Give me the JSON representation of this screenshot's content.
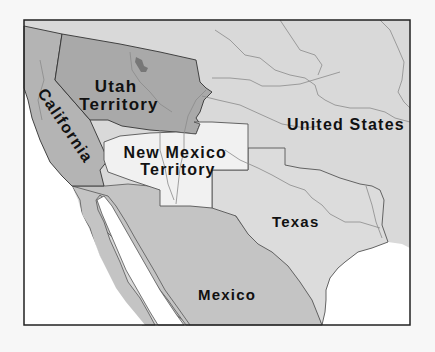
{
  "map": {
    "regions": [
      {
        "id": "utah-territory",
        "label_lines": [
          "Utah",
          "Territory"
        ],
        "fill": "#a9a9a9"
      },
      {
        "id": "california",
        "label": "California",
        "fill": "#b4b4b4"
      },
      {
        "id": "new-mexico-territory",
        "label_lines": [
          "New Mexico",
          "Territory"
        ],
        "fill": "#f1f1f1"
      },
      {
        "id": "united-states",
        "label": "United States",
        "fill": "#d9d9d9"
      },
      {
        "id": "texas",
        "label": "Texas",
        "fill": "#dcdcdc"
      },
      {
        "id": "mexico",
        "label": "Mexico",
        "fill": "#c4c4c4"
      }
    ],
    "colors": {
      "ocean": "#ffffff",
      "background": "#f7f7f7",
      "frame": "#222222",
      "rivers": "#8a8a8a",
      "great_salt_lake": "#7a7a7a"
    }
  }
}
